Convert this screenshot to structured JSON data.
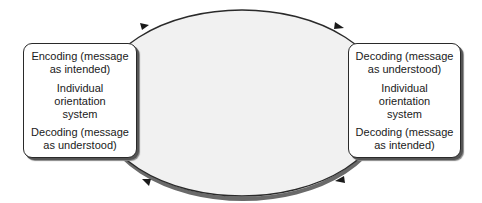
{
  "diagram": {
    "type": "communication-cycle",
    "colors": {
      "ellipse_fill": "#f1f1f1",
      "stroke": "#2a2a2a",
      "box_fill": "#ffffff",
      "shadow": "#555555"
    },
    "left_box": {
      "top": [
        "Encoding (message",
        "as intended)"
      ],
      "middle": [
        "Individual",
        "orientation",
        "system"
      ],
      "bottom": [
        "Decoding (message",
        "as understood)"
      ]
    },
    "right_box": {
      "top": [
        "Decoding (message",
        "as understood)"
      ],
      "middle": [
        "Individual",
        "orientation",
        "system"
      ],
      "bottom": [
        "Decoding (message",
        "as intended)"
      ]
    },
    "arrows": [
      {
        "position": "top-left",
        "direction": "right"
      },
      {
        "position": "top-right",
        "direction": "right"
      },
      {
        "position": "bottom-right",
        "direction": "left"
      },
      {
        "position": "bottom-left",
        "direction": "left"
      }
    ]
  }
}
